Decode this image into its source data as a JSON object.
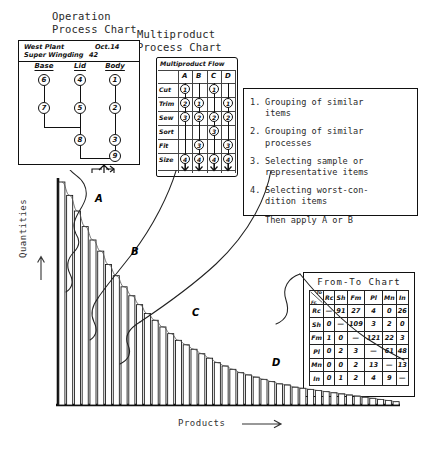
{
  "headings": {
    "operation_process_chart": "Operation\nProcess Chart",
    "multiproduct_process_chart": "Multiproduct\nProcess Chart"
  },
  "operation_process_chart": {
    "title_left": "West Plant",
    "title_right": "Oct.14",
    "subtitle_left": "Super Wingding",
    "subtitle_right": "42",
    "columns": [
      "Base",
      "Lid",
      "Body"
    ],
    "nodes": {
      "base": [
        "6",
        "7"
      ],
      "lid": [
        "4",
        "5"
      ],
      "body": [
        "1",
        "2",
        "3"
      ],
      "merge_lid_base": "8",
      "final": "9"
    }
  },
  "multiproduct_process_chart": {
    "flow_label": "Multiproduct Flow",
    "columns": [
      "A",
      "B",
      "C",
      "D"
    ],
    "rows": [
      "Cut",
      "Trim",
      "Sew",
      "Sort",
      "Fit",
      "Size"
    ],
    "cells": [
      [
        "1",
        "",
        "1",
        ""
      ],
      [
        "2",
        "1",
        "",
        "1"
      ],
      [
        "3",
        "2",
        "2",
        "2"
      ],
      [
        "",
        "",
        "3",
        ""
      ],
      [
        "",
        "3",
        "",
        "3"
      ],
      [
        "4",
        "4",
        "4",
        "4"
      ]
    ]
  },
  "method_list": {
    "items": [
      {
        "num": "1.",
        "text": "Grouping of similar\nitems"
      },
      {
        "num": "2.",
        "text": "Grouping of similar\nprocesses"
      },
      {
        "num": "3.",
        "text": "Selecting sample or\nrepresentative items"
      },
      {
        "num": "4.",
        "text": "Selecting worst-con-\ndition items"
      }
    ],
    "footer": "Then apply A or B"
  },
  "from_to_chart": {
    "title": "From-To Chart",
    "corner_to": "To",
    "corner_fr": "Fr.",
    "columns": [
      "Rc",
      "Sh",
      "Fm",
      "Pl",
      "Mn",
      "In"
    ],
    "rows": [
      {
        "label": "Rc",
        "values": [
          "—",
          "91",
          "27",
          "4",
          "0",
          "26"
        ]
      },
      {
        "label": "Sh",
        "values": [
          "0",
          "—",
          "109",
          "3",
          "2",
          "0"
        ]
      },
      {
        "label": "Fm",
        "values": [
          "1",
          "0",
          "—",
          "121",
          "22",
          "3"
        ]
      },
      {
        "label": "Pl",
        "values": [
          "0",
          "2",
          "3",
          "—",
          "61",
          "48"
        ]
      },
      {
        "label": "Mn",
        "values": [
          "0",
          "0",
          "2",
          "13",
          "—",
          "13"
        ]
      },
      {
        "label": "In",
        "values": [
          "0",
          "1",
          "2",
          "4",
          "9",
          "—"
        ]
      }
    ]
  },
  "chart_data": {
    "type": "bar",
    "title": "",
    "xlabel": "Products",
    "ylabel": "Quantities",
    "grid": false,
    "legend": "none",
    "zone_labels": [
      "A",
      "B",
      "C",
      "D"
    ],
    "categories": [
      "1",
      "2",
      "3",
      "4",
      "5",
      "6",
      "7",
      "8",
      "9",
      "10",
      "11",
      "12",
      "13",
      "14",
      "15",
      "16",
      "17",
      "18",
      "19",
      "20",
      "21",
      "22",
      "23",
      "24",
      "25",
      "26",
      "27",
      "28",
      "29",
      "30",
      "31",
      "32",
      "33",
      "34",
      "35",
      "36",
      "37",
      "38",
      "39",
      "40",
      "41",
      "42",
      "43",
      "44"
    ],
    "values": [
      100,
      94,
      87,
      80,
      74,
      69,
      63,
      58,
      53,
      49,
      45,
      41,
      38,
      35,
      32,
      29,
      27,
      25,
      23,
      21,
      19,
      17.5,
      16,
      14.5,
      13.5,
      12.5,
      11.5,
      10.5,
      9.5,
      9,
      8,
      7.5,
      7,
      6.5,
      6,
      5.5,
      5,
      4.5,
      4,
      3.5,
      3,
      2.5,
      2,
      1.5
    ],
    "ylim": [
      0,
      100
    ]
  },
  "axis_arrow_icons": {
    "y": "arrow-up-icon",
    "x": "arrow-right-icon"
  }
}
